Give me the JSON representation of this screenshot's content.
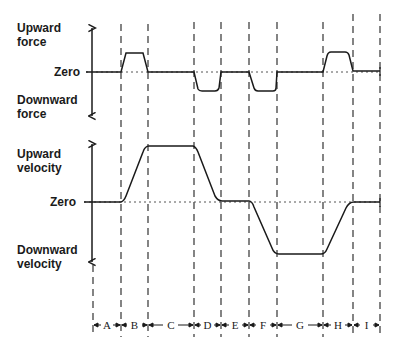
{
  "force_panel": {
    "up_label_1": "Upward",
    "up_label_2": "force",
    "zero_label": "Zero",
    "down_label_1": "Downward",
    "down_label_2": "force"
  },
  "velocity_panel": {
    "up_label_1": "Upward",
    "up_label_2": "velocity",
    "zero_label": "Zero",
    "down_label_1": "Downward",
    "down_label_2": "velocity"
  },
  "intervals": [
    "A",
    "B",
    "C",
    "D",
    "E",
    "F",
    "G",
    "H",
    "I"
  ],
  "boundaries_px": [
    93,
    121,
    148,
    194,
    221,
    249,
    277,
    323,
    353,
    380
  ],
  "colors": {
    "line": "#1a1a1a",
    "dash": "#333333"
  }
}
